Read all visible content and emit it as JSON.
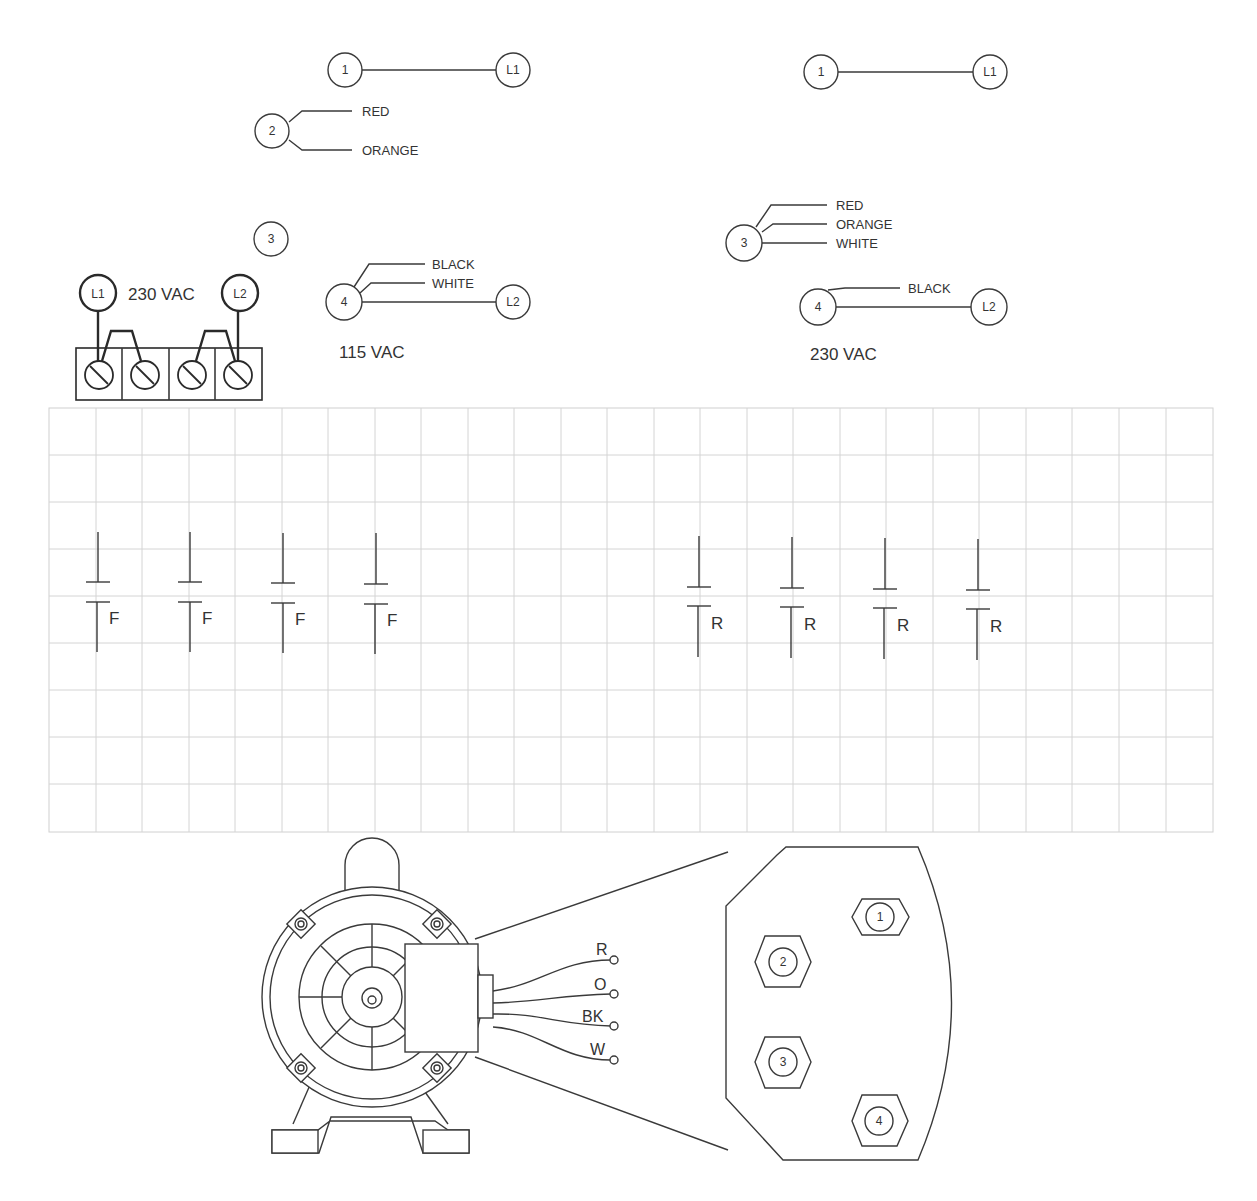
{
  "figure": {
    "top_left_panel": {
      "row1": {
        "terminal": "1",
        "line": "L1"
      },
      "row2": {
        "terminal": "2",
        "wires": [
          "RED",
          "ORANGE"
        ]
      },
      "row3": {
        "terminal": "3"
      },
      "row4": {
        "terminal": "4",
        "wires": [
          "BLACK",
          "WHITE"
        ],
        "line": "L2"
      },
      "voltage": "115 VAC"
    },
    "top_right_panel": {
      "row1": {
        "terminal": "1",
        "line": "L1"
      },
      "row3": {
        "terminal": "3",
        "wires": [
          "RED",
          "ORANGE",
          "WHITE"
        ]
      },
      "row4": {
        "terminal": "4",
        "wires": [
          "BLACK"
        ],
        "line": "L2"
      },
      "voltage": "230 VAC"
    },
    "terminal_block": {
      "left_line": "L1",
      "right_line": "L2",
      "voltage": "230 VAC",
      "screw_count": 4
    },
    "grid": {
      "columns": 25,
      "rows": 9
    },
    "contacts_forward": {
      "label": "F",
      "count": 4
    },
    "contacts_reverse": {
      "label": "R",
      "count": 4
    },
    "motor_leads": [
      "R",
      "O",
      "BK",
      "W"
    ],
    "terminal_plate": {
      "terminals": [
        "1",
        "2",
        "3",
        "4"
      ]
    }
  }
}
